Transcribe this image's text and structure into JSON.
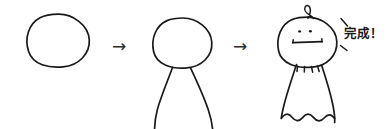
{
  "illustration": {
    "title": "How-to-draw character tutorial strip",
    "medium": "hand-drawn line art",
    "background_color": "#ffffff",
    "ink_color": "#1a1a1a",
    "step_count": 3,
    "steps": [
      {
        "index": 1,
        "name": "circle",
        "description": "hand-drawn circle with slightly flattened bottom",
        "parts": [
          "head-outline"
        ]
      },
      {
        "index": 2,
        "name": "circle-with-legs",
        "description": "same circle with two curved legs splaying outward",
        "parts": [
          "head-outline",
          "left-leg",
          "right-leg"
        ]
      },
      {
        "index": 3,
        "name": "finished-character",
        "description": "head with hair curl, two dot eyes, straight bar mouth, and a dress with pleats and wavy hem",
        "parts": [
          "head-outline",
          "hair-curl",
          "left-eye",
          "right-eye",
          "mouth",
          "collar-pleats",
          "dress",
          "wavy-hem"
        ]
      }
    ],
    "connectors": [
      {
        "name": "arrow-1",
        "glyph": "→"
      },
      {
        "name": "arrow-2",
        "glyph": "→"
      }
    ],
    "caption": {
      "text": "完成！",
      "meaning_label": "complete",
      "emphasis_marks": 2
    },
    "face": {
      "eye_count": 2,
      "mouth_style": "straight bar with end serifs"
    }
  }
}
